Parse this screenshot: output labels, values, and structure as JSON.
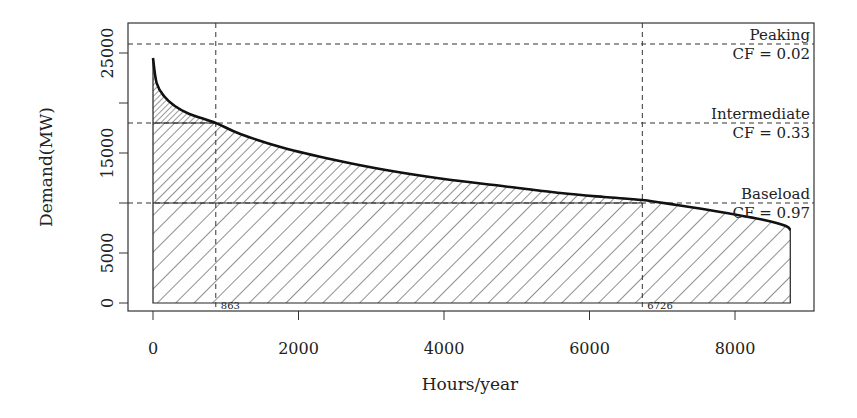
{
  "chart_data": {
    "type": "area",
    "title": "",
    "xlabel": "Hours/year",
    "ylabel": "Demand(MW)",
    "xlim": [
      0,
      8760
    ],
    "ylim": [
      0,
      27000
    ],
    "x_ticks": [
      0,
      2000,
      4000,
      6000,
      8000
    ],
    "x_tick_labels": [
      "0",
      "2000",
      "4000",
      "6000",
      "8000"
    ],
    "y_ticks": [
      0,
      5000,
      10000,
      15000,
      20000,
      25000
    ],
    "y_tick_labels": [
      "0",
      "5000",
      "",
      "15000",
      "",
      "25000"
    ],
    "grid": false,
    "series": [
      {
        "name": "Load duration curve",
        "x": [
          0,
          50,
          150,
          300,
          500,
          863,
          1200,
          1800,
          2500,
          3200,
          4000,
          4800,
          5600,
          6200,
          6726,
          7200,
          7800,
          8400,
          8700,
          8760
        ],
        "y": [
          24500,
          22000,
          20700,
          19700,
          18900,
          18000,
          16900,
          15500,
          14300,
          13300,
          12400,
          11700,
          11000,
          10600,
          10300,
          9800,
          9100,
          8300,
          7700,
          7300
        ]
      }
    ],
    "thresholds": [
      {
        "name": "Peaking",
        "cf_label": "CF = 0.02",
        "demand": 25900
      },
      {
        "name": "Intermediate",
        "cf_label": "CF = 0.33",
        "demand": 18000
      },
      {
        "name": "Baseload",
        "cf_label": "CF = 0.97",
        "demand": 10000
      }
    ],
    "vertical_markers": [
      {
        "x": 863,
        "label": "863"
      },
      {
        "x": 6726,
        "label": "6726"
      }
    ]
  }
}
